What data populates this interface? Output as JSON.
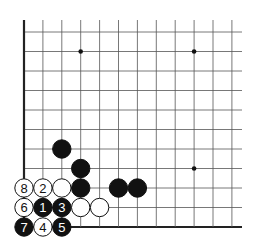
{
  "diagram": {
    "type": "go-board-corner",
    "grid": {
      "origin_x": 24,
      "origin_y": 32,
      "spacing_x": 18.9,
      "spacing_y": 19.5,
      "cols": 12,
      "rows": 11,
      "line_end_x": 242,
      "left_edge_top_y": 20,
      "line_color": "#555555",
      "edge_color": "#222222"
    },
    "star_points": [
      {
        "col": 3,
        "row": 1
      },
      {
        "col": 9,
        "row": 1
      },
      {
        "col": 9,
        "row": 7
      }
    ],
    "stones": [
      {
        "col": 2,
        "row": 6,
        "color": "black",
        "label": ""
      },
      {
        "col": 3,
        "row": 7,
        "color": "black",
        "label": ""
      },
      {
        "col": 3,
        "row": 8,
        "color": "black",
        "label": ""
      },
      {
        "col": 5,
        "row": 8,
        "color": "black",
        "label": ""
      },
      {
        "col": 6,
        "row": 8,
        "color": "black",
        "label": ""
      },
      {
        "col": 2,
        "row": 8,
        "color": "white",
        "label": ""
      },
      {
        "col": 0,
        "row": 8,
        "color": "white",
        "label": "8"
      },
      {
        "col": 1,
        "row": 8,
        "color": "white",
        "label": "2"
      },
      {
        "col": 0,
        "row": 9,
        "color": "white",
        "label": "6"
      },
      {
        "col": 1,
        "row": 9,
        "color": "black",
        "label": "1"
      },
      {
        "col": 2,
        "row": 9,
        "color": "black",
        "label": "3"
      },
      {
        "col": 3,
        "row": 9,
        "color": "white",
        "label": ""
      },
      {
        "col": 4,
        "row": 9,
        "color": "white",
        "label": ""
      },
      {
        "col": 0,
        "row": 10,
        "color": "black",
        "label": "7"
      },
      {
        "col": 1,
        "row": 10,
        "color": "white",
        "label": "4"
      },
      {
        "col": 2,
        "row": 10,
        "color": "black",
        "label": "5"
      }
    ]
  }
}
